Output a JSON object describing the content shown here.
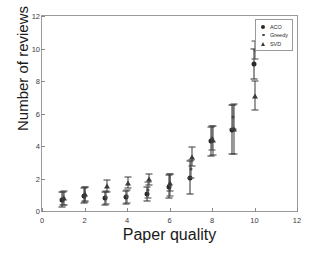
{
  "chart_data": {
    "type": "scatter",
    "title": "",
    "xlabel": "Paper quality",
    "ylabel": "Number of reviews",
    "xlim": [
      0,
      12
    ],
    "ylim": [
      0,
      12
    ],
    "xticks": [
      0,
      2,
      4,
      6,
      8,
      10,
      12
    ],
    "yticks": [
      0,
      2,
      4,
      6,
      8,
      10,
      12
    ],
    "grid": false,
    "legend_position": "top-right",
    "errorbars": "vertical",
    "x": [
      1,
      2,
      3,
      4,
      5,
      6,
      7,
      8,
      9,
      10
    ],
    "series": [
      {
        "name": "ACO",
        "marker": "filled-circle",
        "color": "#2a2a2a",
        "values": [
          0.7,
          0.95,
          0.8,
          0.85,
          1.05,
          1.5,
          2.05,
          4.3,
          5.0,
          9.05
        ],
        "errors": [
          0.45,
          0.45,
          0.4,
          0.4,
          0.45,
          0.7,
          1.0,
          0.9,
          1.5,
          0.95
        ]
      },
      {
        "name": "Greedy",
        "marker": "small-dot",
        "color": "#4a4a4a",
        "values": [
          0.75,
          1.0,
          0.85,
          0.9,
          1.3,
          1.6,
          2.6,
          4.5,
          5.8,
          9.9
        ],
        "errors": [
          0.4,
          0.45,
          0.4,
          0.4,
          0.5,
          0.65,
          0.55,
          0.75,
          0.75,
          0.55
        ]
      },
      {
        "name": "SVD",
        "marker": "triangle",
        "color": "#3a3a3a",
        "values": [
          0.8,
          1.05,
          1.55,
          1.75,
          1.95,
          1.75,
          3.35,
          4.35,
          5.05,
          7.1
        ],
        "errors": [
          0.45,
          0.45,
          0.35,
          0.35,
          0.35,
          0.5,
          0.6,
          0.9,
          1.55,
          0.9
        ]
      }
    ]
  },
  "legend": {
    "items": [
      {
        "label": "ACO",
        "symbol": "filled-circle"
      },
      {
        "label": "Greedy",
        "symbol": "small-dot"
      },
      {
        "label": "SVD",
        "symbol": "triangle"
      }
    ]
  },
  "axes": {
    "x_title": "Paper quality",
    "y_title": "Number of reviews",
    "x_tick_labels": [
      "0",
      "2",
      "4",
      "6",
      "8",
      "10",
      "12"
    ],
    "y_tick_labels": [
      "0",
      "2",
      "4",
      "6",
      "8",
      "10",
      "12"
    ]
  }
}
